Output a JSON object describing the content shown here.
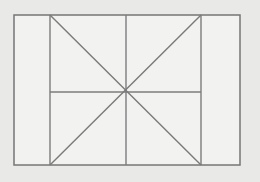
{
  "figure": {
    "kind": "line-drawing",
    "canvas": {
      "width": 260,
      "height": 182
    },
    "colors": {
      "background": "#e9e9e7",
      "interior_fill": "#f2f2f0",
      "stroke": "#7d7d7d",
      "frame_stroke": "#767676",
      "diagonal_stroke": "#7a7a7a"
    },
    "frame": {
      "label": "outer-rectangle",
      "left": 14,
      "top": 15,
      "right": 240,
      "bottom": 165,
      "width": 226,
      "height": 150
    },
    "vertical_lines": [
      {
        "label": "left-divider",
        "x": 50,
        "y1": 15,
        "y2": 165
      },
      {
        "label": "center-axis",
        "x": 126,
        "y1": 15,
        "y2": 165
      },
      {
        "label": "right-divider",
        "x": 201,
        "y1": 15,
        "y2": 165
      }
    ],
    "horizontal_lines": [
      {
        "label": "median-line",
        "y": 92,
        "x1": 50,
        "x2": 201
      }
    ],
    "diagonals": [
      {
        "label": "diagonal-down-right",
        "x1": 50,
        "y1": 15,
        "x2": 201,
        "y2": 165
      },
      {
        "label": "diagonal-down-left",
        "x1": 201,
        "y1": 15,
        "x2": 50,
        "y2": 165
      }
    ],
    "intersection": {
      "label": "center-point",
      "x": 126,
      "y": 92
    }
  }
}
